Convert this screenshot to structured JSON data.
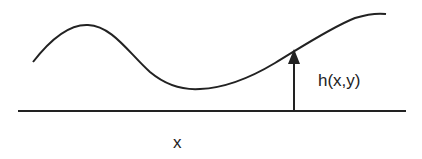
{
  "diagram": {
    "height_label": "h(x,y)",
    "axis_label": "x",
    "colors": {
      "stroke": "#222222",
      "background": "#ffffff"
    }
  }
}
